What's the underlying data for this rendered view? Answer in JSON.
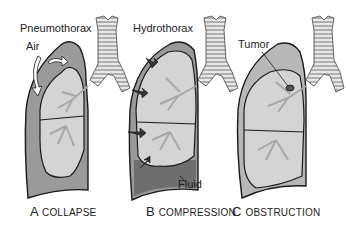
{
  "diagram": {
    "panels": [
      {
        "letter": "A",
        "caption": "COLLAPSE",
        "labels": [
          "Pneumothorax",
          "Air"
        ]
      },
      {
        "letter": "B",
        "caption": "COMPRESSION",
        "labels": [
          "Hydrothorax",
          "Fluid"
        ]
      },
      {
        "letter": "C",
        "caption": "OBSTRUCTION",
        "labels": [
          "Tumor"
        ]
      }
    ],
    "colors": {
      "pleural_space": "#9a9a9a",
      "lung": "#d4d4d4",
      "fluid": "#6e6e6e",
      "outline": "#1a1a1a",
      "bronchi": "#a8a8a8"
    }
  }
}
